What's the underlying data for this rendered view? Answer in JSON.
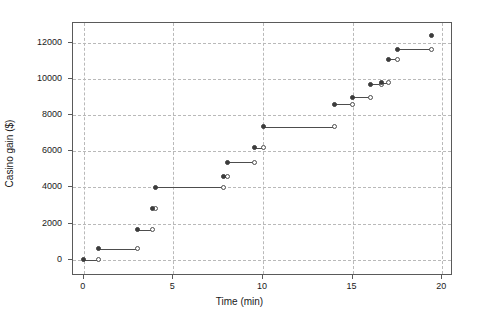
{
  "chart_data": {
    "type": "line",
    "subtype": "step-function",
    "title": "",
    "xlabel": "Time (min)",
    "ylabel": "Casino gain ($)",
    "xlim": [
      -0.6,
      20.6
    ],
    "ylim": [
      -900,
      13100
    ],
    "xticks": [
      0,
      5,
      10,
      15,
      20
    ],
    "xticklabels": [
      "0",
      "5",
      "10",
      "15",
      "20"
    ],
    "yticks": [
      0,
      2000,
      4000,
      6000,
      8000,
      10000,
      12000
    ],
    "yticklabels": [
      "0",
      "2000",
      "4000",
      "6000",
      "8000",
      "10000",
      "12000"
    ],
    "grid": true,
    "grid_style": "dashed",
    "grid_color": "#b9b9b9",
    "legend": null,
    "line_color": "#4d4d4d",
    "marker_closed_color": "#3c3c3c",
    "marker_open_color": "#ffffff",
    "steps": [
      {
        "x_start": 0.0,
        "x_end": 0.85,
        "y": 0
      },
      {
        "x_start": 0.85,
        "x_end": 3.0,
        "y": 600
      },
      {
        "x_start": 3.0,
        "x_end": 3.85,
        "y": 1650
      },
      {
        "x_start": 3.85,
        "x_end": 4.0,
        "y": 2850
      },
      {
        "x_start": 4.0,
        "x_end": 7.8,
        "y": 4000
      },
      {
        "x_start": 7.8,
        "x_end": 8.0,
        "y": 4600
      },
      {
        "x_start": 8.0,
        "x_end": 9.5,
        "y": 5400
      },
      {
        "x_start": 9.5,
        "x_end": 10.0,
        "y": 6200
      },
      {
        "x_start": 10.0,
        "x_end": 14.0,
        "y": 7350
      },
      {
        "x_start": 14.0,
        "x_end": 15.0,
        "y": 8600
      },
      {
        "x_start": 15.0,
        "x_end": 16.0,
        "y": 9000
      },
      {
        "x_start": 16.0,
        "x_end": 16.6,
        "y": 9700
      },
      {
        "x_start": 16.6,
        "x_end": 17.0,
        "y": 9800
      },
      {
        "x_start": 17.0,
        "x_end": 17.5,
        "y": 11100
      },
      {
        "x_start": 17.5,
        "x_end": 19.4,
        "y": 11650
      }
    ],
    "final_point": {
      "x": 19.4,
      "y": 12400
    },
    "x": [
      0.0,
      0.85,
      3.0,
      3.85,
      4.0,
      7.8,
      8.0,
      9.5,
      10.0,
      14.0,
      15.0,
      16.0,
      16.6,
      17.0,
      17.5,
      19.4
    ],
    "values": [
      0,
      600,
      1650,
      2850,
      4000,
      4600,
      5400,
      6200,
      7350,
      8600,
      9000,
      9700,
      9800,
      11100,
      11650,
      12400
    ]
  }
}
